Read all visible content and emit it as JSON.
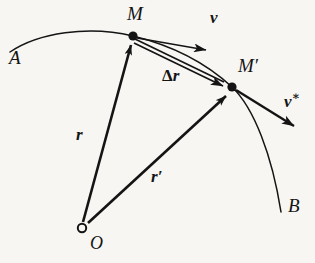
{
  "figure": {
    "kind": "vector-kinematics-diagram",
    "background_color": "#f7f6f3",
    "ink_color": "#141414",
    "width": 315,
    "height": 263,
    "labels": {
      "curve_start": "A",
      "curve_end": "B",
      "point_m": "M",
      "point_m_prime_base": "M",
      "point_m_prime_mark": "′",
      "origin": "O",
      "vector_r": "r",
      "vector_r_prime_base": "r",
      "vector_r_prime_mark": "′",
      "vector_delta_r_symbol": "Δ",
      "vector_delta_r_base": "r",
      "vector_v": "v",
      "vector_v_star_base": "v",
      "vector_v_star_mark": "∗"
    },
    "geometry": {
      "origin_point": [
        82,
        228
      ],
      "point_m": [
        133,
        36
      ],
      "point_m_prime": [
        232,
        87
      ],
      "curve_a_start": [
        10,
        52
      ],
      "curve_b_end": [
        281,
        212
      ],
      "v_tip": [
        215,
        47
      ],
      "v_star_tip": [
        303,
        131
      ]
    },
    "elements": [
      {
        "name": "trajectory-curve",
        "description": "smooth arc from A through M and M' to B"
      },
      {
        "name": "radius-vector-r",
        "description": "arrow from O to M"
      },
      {
        "name": "radius-vector-r-prime",
        "description": "arrow from O to M'"
      },
      {
        "name": "displacement-vector-delta-r",
        "description": "arrow from M to M'"
      },
      {
        "name": "velocity-vector-v",
        "description": "arrow at M tangent to path"
      },
      {
        "name": "velocity-vector-v-star",
        "description": "arrow at M' tangent to path"
      },
      {
        "name": "origin-marker",
        "description": "small open circle at O"
      },
      {
        "name": "point-marker-m",
        "description": "filled dot at M"
      },
      {
        "name": "point-marker-m-prime",
        "description": "filled dot at M'"
      }
    ]
  }
}
